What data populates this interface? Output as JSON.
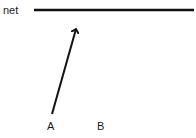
{
  "diagram": {
    "net_label": "net",
    "point_a_label": "A",
    "point_b_label": "B",
    "net_line": {
      "x1": 34,
      "y1": 10,
      "x2": 194,
      "y2": 10
    },
    "arrow": {
      "from_label": "A",
      "to": "net",
      "x1": 52,
      "y1": 114,
      "x2": 76,
      "y2": 28
    },
    "stroke_color": "#111111"
  }
}
